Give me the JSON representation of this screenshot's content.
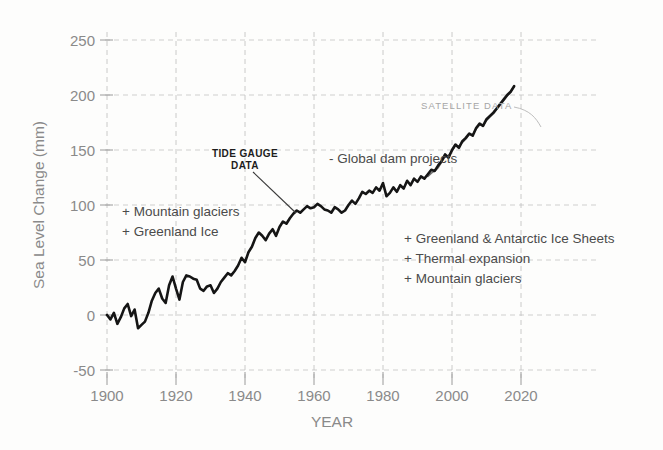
{
  "chart_data": {
    "type": "line",
    "title": "",
    "xlabel": "YEAR",
    "ylabel": "Sea Level Change (mm)",
    "xlim": [
      1896,
      2026
    ],
    "ylim": [
      -60,
      262
    ],
    "xticks": [
      1900,
      1920,
      1940,
      1960,
      1980,
      2000,
      2020
    ],
    "yticks": [
      -50,
      0,
      50,
      100,
      150,
      200,
      250
    ],
    "xtick_labels": [
      "1900",
      "1920",
      "1940",
      "1960",
      "1980",
      "2000",
      "2020"
    ],
    "ytick_labels": [
      "-50",
      "0",
      "50",
      "100",
      "150",
      "200",
      "250"
    ],
    "grid": true,
    "legend": "none",
    "series": [
      {
        "name": "TIDE GAUGE DATA",
        "color": "#151515",
        "x": [
          1900,
          1901,
          1902,
          1903,
          1904,
          1905,
          1906,
          1907,
          1908,
          1909,
          1910,
          1911,
          1912,
          1913,
          1914,
          1915,
          1916,
          1917,
          1918,
          1919,
          1920,
          1921,
          1922,
          1923,
          1924,
          1925,
          1926,
          1927,
          1928,
          1929,
          1930,
          1931,
          1932,
          1933,
          1934,
          1935,
          1936,
          1937,
          1938,
          1939,
          1940,
          1941,
          1942,
          1943,
          1944,
          1945,
          1946,
          1947,
          1948,
          1949,
          1950,
          1951,
          1952,
          1953,
          1954,
          1955,
          1956,
          1957,
          1958,
          1959,
          1960,
          1961,
          1962,
          1963,
          1964,
          1965,
          1966,
          1967,
          1968,
          1969,
          1970,
          1971,
          1972,
          1973,
          1974,
          1975,
          1976,
          1977,
          1978,
          1979,
          1980,
          1981,
          1982,
          1983,
          1984,
          1985,
          1986,
          1987,
          1988,
          1989,
          1990,
          1991,
          1992,
          1993,
          1994,
          1995,
          1996,
          1997,
          1998,
          1999,
          2000,
          2001,
          2002,
          2003,
          2004,
          2005,
          2006,
          2007,
          2008,
          2009,
          2010,
          2011,
          2012,
          2013,
          2014,
          2015,
          2016,
          2017,
          2018
        ],
        "y": [
          0,
          -4,
          2,
          -8,
          -2,
          6,
          10,
          -1,
          5,
          -12,
          -9,
          -6,
          2,
          13,
          20,
          24,
          15,
          11,
          27,
          35,
          24,
          14,
          30,
          36,
          35,
          33,
          32,
          24,
          22,
          26,
          27,
          20,
          24,
          30,
          34,
          38,
          36,
          40,
          45,
          52,
          48,
          57,
          62,
          70,
          75,
          72,
          68,
          74,
          78,
          72,
          80,
          85,
          83,
          88,
          92,
          95,
          93,
          96,
          99,
          97,
          98,
          101,
          99,
          96,
          95,
          93,
          98,
          96,
          93,
          95,
          100,
          104,
          101,
          106,
          112,
          110,
          113,
          111,
          116,
          113,
          120,
          108,
          111,
          116,
          112,
          118,
          115,
          122,
          118,
          124,
          121,
          126,
          124,
          128,
          132,
          131,
          136,
          140,
          146,
          143,
          150,
          155,
          152,
          158,
          161,
          165,
          163,
          170,
          174,
          172,
          178,
          181,
          184,
          188,
          192,
          196,
          200,
          203,
          208
        ],
        "ylabel_units": "mm"
      },
      {
        "name": "SATELLITE DATA",
        "color": "#6f6f6f",
        "x": [
          1993,
          1994,
          1995,
          1996,
          1997,
          1998,
          1999,
          2000,
          2001,
          2002,
          2003,
          2004,
          2005,
          2006,
          2007,
          2008,
          2009,
          2010,
          2011,
          2012,
          2013,
          2014,
          2015,
          2016,
          2017,
          2018
        ],
        "y": [
          126,
          129,
          131,
          134,
          139,
          144,
          145,
          149,
          154,
          153,
          157,
          160,
          164,
          164,
          169,
          173,
          172,
          177,
          180,
          183,
          187,
          191,
          195,
          199,
          203,
          208
        ],
        "ylabel_units": "mm"
      }
    ],
    "annotations": [
      {
        "id": "tide-gauge-label",
        "text_lines": [
          "TIDE GAUGE",
          "DATA"
        ],
        "style": "bold-dark",
        "x": 1944,
        "y": 142
      },
      {
        "id": "satellite-label",
        "text_lines": [
          "SATELLITE DATA"
        ],
        "style": "light-gray",
        "x": 1995,
        "y": 196
      },
      {
        "id": "global-dam-projects",
        "text_lines": [
          "- Global dam projects"
        ],
        "style": "plain",
        "x": 1963,
        "y": 148
      },
      {
        "id": "left-contributors",
        "text_lines": [
          "+ Mountain glaciers",
          "+ Greenland Ice"
        ],
        "style": "plain",
        "x": 1907,
        "y": 80
      },
      {
        "id": "right-contributors",
        "text_lines": [
          "+ Greenland & Antarctic Ice Sheets",
          "+ Thermal expansion",
          "+ Mountain glaciers"
        ],
        "style": "plain",
        "x": 1984,
        "y": 44
      }
    ],
    "colors": {
      "tide_gauge": "#151515",
      "satellite": "#6f6f6f",
      "grid": "#c9c9c9",
      "axis_text": "#8a8a8a",
      "annotation_text": "#4b4b4b",
      "background": "#fdfdfc"
    }
  },
  "axis": {
    "y_title": "Sea Level Change (mm)",
    "x_title": "YEAR",
    "y_ticks": [
      "250",
      "200",
      "150",
      "100",
      "50",
      "0",
      "-50"
    ],
    "x_ticks": [
      "1900",
      "1920",
      "1940",
      "1960",
      "1980",
      "2000",
      "2020"
    ]
  },
  "annotations": {
    "tide_gauge_line1": "TIDE GAUGE",
    "tide_gauge_line2": "DATA",
    "satellite": "SATELLITE DATA",
    "dam_projects": "- Global dam projects",
    "left_1": "+ Mountain glaciers",
    "left_2": "+ Greenland Ice",
    "right_1": "+ Greenland & Antarctic Ice Sheets",
    "right_2": "+ Thermal expansion",
    "right_3": "+ Mountain glaciers"
  }
}
